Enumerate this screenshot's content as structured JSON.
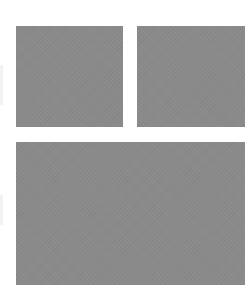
{
  "layout": {
    "background": "#ffffff",
    "tile_color": "#8a8a8a",
    "tiles": [
      {
        "id": "top-left",
        "x": 16,
        "y": 26,
        "width": 107,
        "height": 101
      },
      {
        "id": "top-right",
        "x": 137,
        "y": 26,
        "width": 108,
        "height": 101
      },
      {
        "id": "bottom-wide",
        "x": 16,
        "y": 142,
        "width": 229,
        "height": 143
      }
    ]
  }
}
